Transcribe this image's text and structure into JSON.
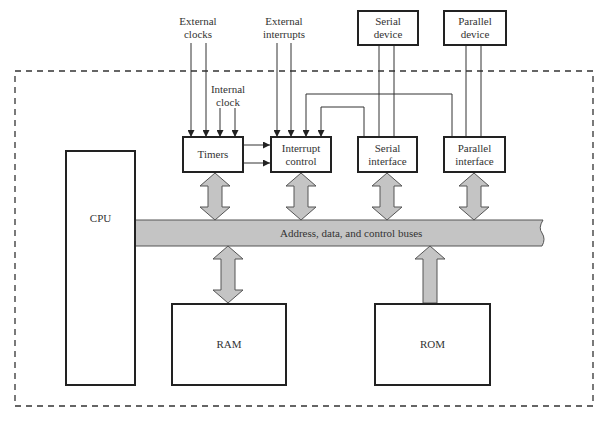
{
  "diagram": {
    "type": "block-diagram",
    "boundary": "dashed microcontroller boundary",
    "external_inputs": {
      "external_clocks": "External\nclocks",
      "external_interrupts": "External\ninterrupts",
      "internal_clock": "Internal\nclock"
    },
    "external_devices": {
      "serial_device": "Serial\ndevice",
      "parallel_device": "Parallel\ndevice"
    },
    "blocks": {
      "cpu": "CPU",
      "timers": "Timers",
      "interrupt_control": "Interrupt\ncontrol",
      "serial_interface": "Serial\ninterface",
      "parallel_interface": "Parallel\ninterface",
      "ram": "RAM",
      "rom": "ROM"
    },
    "bus": {
      "label": "Address, data, and control buses",
      "fill": "#c4c4c4"
    },
    "connections": [
      {
        "from": "timers",
        "to": "bus",
        "type": "bidirectional"
      },
      {
        "from": "interrupt_control",
        "to": "bus",
        "type": "bidirectional"
      },
      {
        "from": "serial_interface",
        "to": "bus",
        "type": "bidirectional"
      },
      {
        "from": "parallel_interface",
        "to": "bus",
        "type": "bidirectional"
      },
      {
        "from": "ram",
        "to": "bus",
        "type": "bidirectional"
      },
      {
        "from": "rom",
        "to": "bus",
        "type": "unidirectional"
      },
      {
        "from": "timers",
        "to": "interrupt_control",
        "type": "signal x2"
      },
      {
        "from": "serial_interface",
        "to": "interrupt_control",
        "type": "signal"
      },
      {
        "from": "parallel_interface",
        "to": "interrupt_control",
        "type": "signal"
      },
      {
        "from": "external_clocks",
        "to": "timers",
        "type": "signal x2"
      },
      {
        "from": "internal_clock",
        "to": "timers",
        "type": "signal x2"
      },
      {
        "from": "external_interrupts",
        "to": "interrupt_control",
        "type": "signal x2"
      },
      {
        "from": "serial_device",
        "to": "serial_interface",
        "type": "line x2"
      },
      {
        "from": "parallel_device",
        "to": "parallel_interface",
        "type": "line x2"
      }
    ]
  }
}
